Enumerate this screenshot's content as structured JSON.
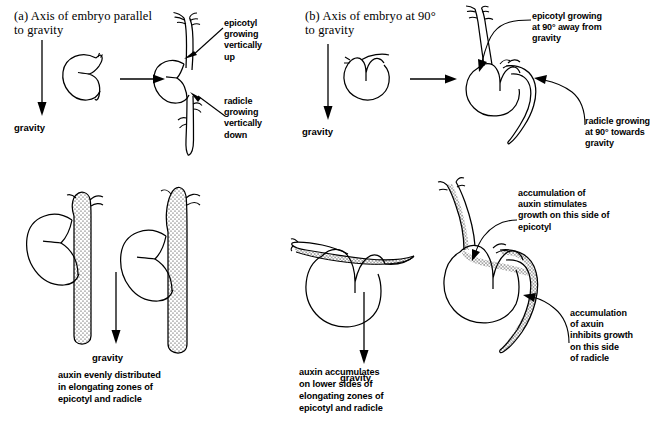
{
  "figure": {
    "title_a": "(a) Axis of embryo parallel to gravity",
    "title_b": "(b) Axis of embryo at 90° to gravity"
  },
  "panel_a": {
    "heading_line1": "(a) Axis of embryo parallel",
    "heading_line2": "to gravity",
    "gravity_label": "gravity",
    "label_epicotyl": "epicotyl\ngrowing\nvertically\nup",
    "label_radicle": "radicle\ngrowing\nvertically\ndown"
  },
  "panel_b": {
    "heading_line1": "(b) Axis of embryo at 90°",
    "heading_line2": "to gravity",
    "gravity_label": "gravity",
    "label_epicotyl": "epicotyl growing\nat 90° away from\ngravity",
    "label_radicle": "radicle growing\nat 90° towards\ngravity"
  },
  "panel_c": {
    "gravity_label": "gravity",
    "caption": "auxin evenly distributed\nin elongating zones of\nepicotyl and radicle"
  },
  "panel_d": {
    "gravity_label": "gravity",
    "caption": "auxin accumulates\non lower sides of\nelongating zones of\nepicotyl and radicle",
    "label_epicotyl": "accumulation of\nauxin stimulates\ngrowth on this side of\nepicotyl",
    "label_radicle": "accumulation\nof axuin\ninhibits growth\non this side\nof radicle"
  },
  "style": {
    "ink": "#000000",
    "paper": "#ffffff",
    "stipple": "#1a1a1a"
  }
}
